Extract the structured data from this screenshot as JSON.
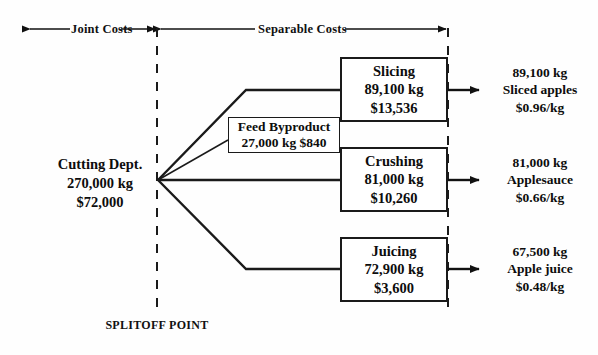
{
  "diagram": {
    "header": {
      "joint_costs_label": "Joint Costs",
      "separable_costs_label": "Separable Costs"
    },
    "splitoff_label": "SPLITOFF POINT",
    "source": {
      "name": "Cutting Dept.",
      "quantity": "270,000 kg",
      "cost": "$72,000"
    },
    "byproduct": {
      "name": "Feed Byproduct",
      "detail": "27,000 kg  $840"
    },
    "processes": [
      {
        "name": "Slicing",
        "quantity": "89,100 kg",
        "cost": "$13,536"
      },
      {
        "name": "Crushing",
        "quantity": "81,000 kg",
        "cost": "$10,260"
      },
      {
        "name": "Juicing",
        "quantity": "72,900 kg",
        "cost": "$3,600"
      }
    ],
    "outputs": [
      {
        "quantity": "89,100 kg",
        "product": "Sliced apples",
        "price": "$0.96/kg"
      },
      {
        "quantity": "81,000 kg",
        "product": "Applesauce",
        "price": "$0.66/kg"
      },
      {
        "quantity": "67,500 kg",
        "product": "Apple juice",
        "price": "$0.48/kg"
      }
    ],
    "colors": {
      "ink": "#0d0d0d",
      "line": "#1a1a1a",
      "background": "#fefefe"
    }
  }
}
